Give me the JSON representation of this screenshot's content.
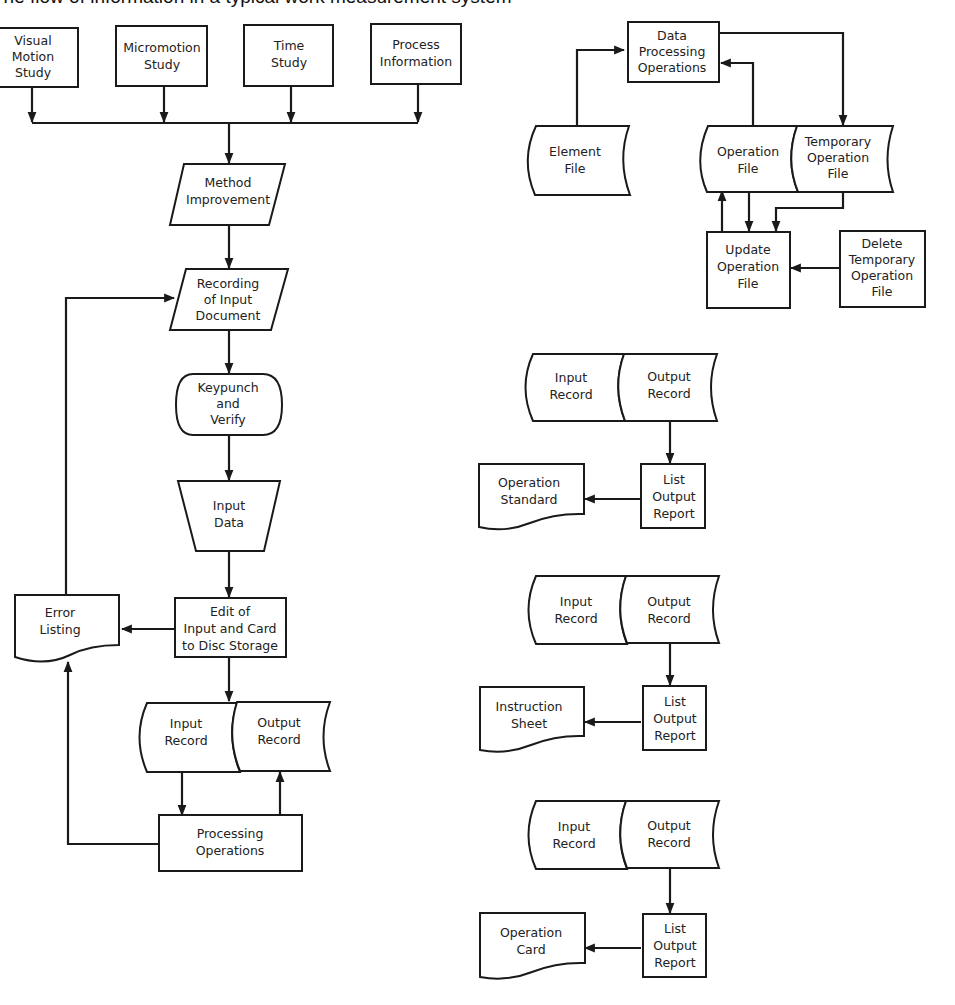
{
  "title": "The flow of information in a typical work measurement system",
  "nodes": {
    "visual_motion_study": {
      "shape": "process",
      "lines": [
        "Visual",
        "Motion",
        "Study"
      ]
    },
    "micromotion_study": {
      "shape": "process",
      "lines": [
        "Micromotion",
        "Study"
      ]
    },
    "time_study": {
      "shape": "process",
      "lines": [
        "Time",
        "Study"
      ]
    },
    "process_information": {
      "shape": "process",
      "lines": [
        "Process",
        "Information"
      ]
    },
    "method_improvement": {
      "shape": "input-output",
      "lines": [
        "Method",
        "Improvement"
      ]
    },
    "recording_input_document": {
      "shape": "input-output",
      "lines": [
        "Recording",
        "of Input",
        "Document"
      ]
    },
    "keypunch_verify": {
      "shape": "terminal",
      "lines": [
        "Keypunch",
        "and",
        "Verify"
      ]
    },
    "input_data": {
      "shape": "manual-operation",
      "lines": [
        "Input",
        "Data"
      ]
    },
    "edit_input": {
      "shape": "process",
      "lines": [
        "Edit of",
        "Input and Card",
        "to Disc Storage"
      ]
    },
    "error_listing": {
      "shape": "document",
      "lines": [
        "Error",
        "Listing"
      ]
    },
    "main_input_record": {
      "shape": "storage",
      "lines": [
        "Input",
        "Record"
      ]
    },
    "main_output_record": {
      "shape": "storage",
      "lines": [
        "Output",
        "Record"
      ]
    },
    "processing_operations": {
      "shape": "process",
      "lines": [
        "Processing",
        "Operations"
      ]
    },
    "data_processing_operations": {
      "shape": "process",
      "lines": [
        "Data",
        "Processing",
        "Operations"
      ]
    },
    "element_file": {
      "shape": "storage",
      "lines": [
        "Element",
        "File"
      ]
    },
    "operation_file": {
      "shape": "storage",
      "lines": [
        "Operation",
        "File"
      ]
    },
    "temporary_operation_file": {
      "shape": "storage",
      "lines": [
        "Temporary",
        "Operation",
        "File"
      ]
    },
    "update_operation_file": {
      "shape": "process",
      "lines": [
        "Update",
        "Operation",
        "File"
      ]
    },
    "delete_temporary_operation_file": {
      "shape": "process",
      "lines": [
        "Delete",
        "Temporary",
        "Operation",
        "File"
      ]
    },
    "g1_input_record": {
      "shape": "storage",
      "lines": [
        "Input",
        "Record"
      ]
    },
    "g1_output_record": {
      "shape": "storage",
      "lines": [
        "Output",
        "Record"
      ]
    },
    "g1_list_output_report": {
      "shape": "process",
      "lines": [
        "List",
        "Output",
        "Report"
      ]
    },
    "g1_operation_standard": {
      "shape": "document",
      "lines": [
        "Operation",
        "Standard"
      ]
    },
    "g2_input_record": {
      "shape": "storage",
      "lines": [
        "Input",
        "Record"
      ]
    },
    "g2_output_record": {
      "shape": "storage",
      "lines": [
        "Output",
        "Record"
      ]
    },
    "g2_list_output_report": {
      "shape": "process",
      "lines": [
        "List",
        "Output",
        "Report"
      ]
    },
    "g2_instruction_sheet": {
      "shape": "document",
      "lines": [
        "Instruction",
        "Sheet"
      ]
    },
    "g3_input_record": {
      "shape": "storage",
      "lines": [
        "Input",
        "Record"
      ]
    },
    "g3_output_record": {
      "shape": "storage",
      "lines": [
        "Output",
        "Record"
      ]
    },
    "g3_list_output_report": {
      "shape": "process",
      "lines": [
        "List",
        "Output",
        "Report"
      ]
    },
    "g3_operation_card": {
      "shape": "document",
      "lines": [
        "Operation",
        "Card"
      ]
    }
  },
  "edges": [
    {
      "from": "visual_motion_study",
      "to": "method_improvement"
    },
    {
      "from": "micromotion_study",
      "to": "method_improvement"
    },
    {
      "from": "time_study",
      "to": "method_improvement"
    },
    {
      "from": "process_information",
      "to": "method_improvement"
    },
    {
      "from": "method_improvement",
      "to": "recording_input_document"
    },
    {
      "from": "recording_input_document",
      "to": "keypunch_verify"
    },
    {
      "from": "keypunch_verify",
      "to": "input_data"
    },
    {
      "from": "input_data",
      "to": "edit_input"
    },
    {
      "from": "edit_input",
      "to": "error_listing"
    },
    {
      "from": "error_listing",
      "to": "recording_input_document"
    },
    {
      "from": "edit_input",
      "to": "main_input_record"
    },
    {
      "from": "main_input_record",
      "to": "processing_operations"
    },
    {
      "from": "processing_operations",
      "to": "main_output_record"
    },
    {
      "from": "processing_operations",
      "to": "error_listing"
    },
    {
      "from": "element_file",
      "to": "data_processing_operations"
    },
    {
      "from": "operation_file",
      "to": "data_processing_operations"
    },
    {
      "from": "data_processing_operations",
      "to": "temporary_operation_file"
    },
    {
      "from": "operation_file",
      "to": "update_operation_file"
    },
    {
      "from": "update_operation_file",
      "to": "operation_file"
    },
    {
      "from": "temporary_operation_file",
      "to": "update_operation_file"
    },
    {
      "from": "delete_temporary_operation_file",
      "to": "update_operation_file"
    },
    {
      "from": "g1_output_record",
      "to": "g1_list_output_report"
    },
    {
      "from": "g1_list_output_report",
      "to": "g1_operation_standard"
    },
    {
      "from": "g2_output_record",
      "to": "g2_list_output_report"
    },
    {
      "from": "g2_list_output_report",
      "to": "g2_instruction_sheet"
    },
    {
      "from": "g3_output_record",
      "to": "g3_list_output_report"
    },
    {
      "from": "g3_list_output_report",
      "to": "g3_operation_card"
    }
  ]
}
